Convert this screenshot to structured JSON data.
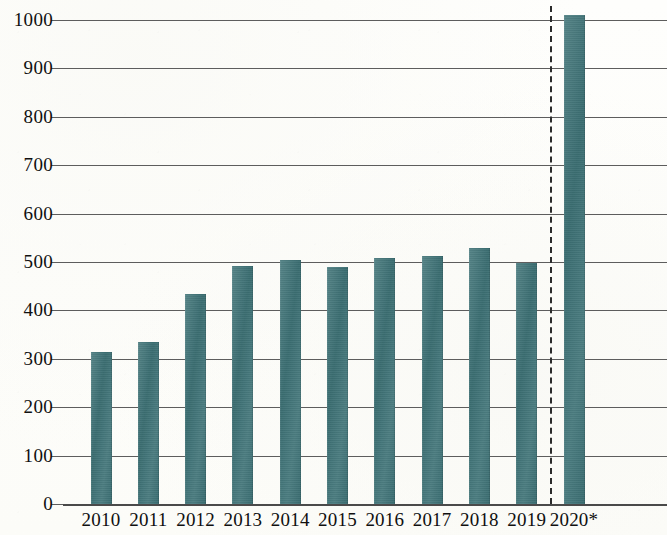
{
  "chart_data": {
    "type": "bar",
    "title": "",
    "subtitle": "",
    "xlabel": "",
    "ylabel": "",
    "categories": [
      "2010",
      "2011",
      "2012",
      "2013",
      "2014",
      "2015",
      "2016",
      "2017",
      "2018",
      "2019",
      "2020*"
    ],
    "values": [
      315,
      335,
      434,
      492,
      504,
      489,
      509,
      513,
      528,
      497,
      1010
    ],
    "series": [
      {
        "name": "",
        "values": [
          315,
          335,
          434,
          492,
          504,
          489,
          509,
          513,
          528,
          497,
          1010
        ]
      }
    ],
    "ylim": [
      0,
      1000
    ],
    "y_ticks": [
      0,
      100,
      200,
      300,
      400,
      500,
      600,
      700,
      800,
      900,
      1000
    ],
    "y_tick_labels": [
      "0",
      "100",
      "200",
      "300",
      "400",
      "500",
      "600",
      "700",
      "800",
      "900",
      "1000"
    ],
    "grid": true,
    "grid_axis": "y",
    "legend": false,
    "legend_position": "none",
    "bar_color": "#3e7377",
    "grid_color": "#5d5d5d",
    "axis_color": "#4a4a4a",
    "text_color": "#101010",
    "background_color": "#fdfdfb",
    "annotations": [
      {
        "type": "vertical-dashed-line",
        "name": "forecast-divider",
        "between": [
          "2019",
          "2020*"
        ],
        "color": "#2b2b2b",
        "style": "dashed"
      },
      {
        "type": "footnote-marker",
        "name": "projection-asterisk",
        "text": "*",
        "applies_to": "2020*"
      }
    ]
  }
}
